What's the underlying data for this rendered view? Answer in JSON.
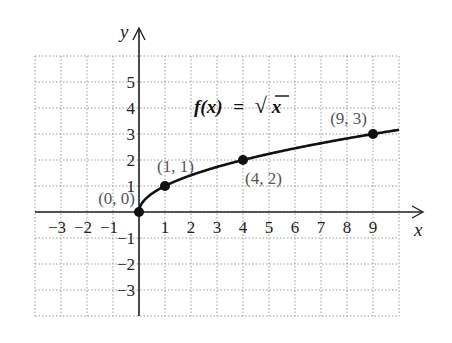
{
  "chart_data": {
    "type": "line",
    "title": "",
    "function_label": "f(x) = √x",
    "function_label_parts": {
      "lhs": "f(x)",
      "eq": "=",
      "sqrt": "√",
      "arg": "x"
    },
    "xlabel": "x",
    "ylabel": "y",
    "xlim": [
      -4,
      10
    ],
    "ylim": [
      -4,
      6
    ],
    "grid": true,
    "x_ticks": [
      -3,
      -2,
      -1,
      1,
      2,
      3,
      4,
      5,
      6,
      7,
      8,
      9
    ],
    "x_tick_labels": [
      "−3",
      "−2",
      "−1",
      "1",
      "2",
      "3",
      "4",
      "5",
      "6",
      "7",
      "8",
      "9"
    ],
    "y_ticks": [
      5,
      4,
      3,
      2,
      1,
      -1,
      -2,
      -3
    ],
    "y_tick_labels": [
      "5",
      "4",
      "3",
      "2",
      "1",
      "−1",
      "−2",
      "−3"
    ],
    "series": [
      {
        "name": "f(x) = √x",
        "x_range": [
          0,
          10
        ],
        "color": "#111111"
      }
    ],
    "points": [
      {
        "x": 0,
        "y": 0,
        "label": "(0, 0)"
      },
      {
        "x": 1,
        "y": 1,
        "label": "(1, 1)"
      },
      {
        "x": 4,
        "y": 2,
        "label": "(4, 2)"
      },
      {
        "x": 9,
        "y": 3,
        "label": "(9, 3)"
      }
    ]
  },
  "colors": {
    "grid": "#9a9a9a",
    "axis": "#222222",
    "curve": "#111111",
    "point_label": "#555555"
  }
}
